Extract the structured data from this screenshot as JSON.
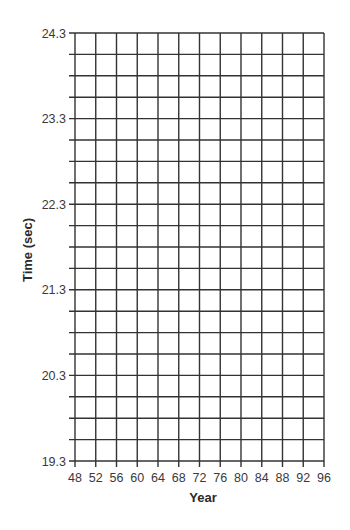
{
  "chart_data": {
    "type": "line",
    "title": "",
    "xlabel": "Year",
    "ylabel": "Time (sec)",
    "x_ticks": [
      48,
      52,
      56,
      60,
      64,
      68,
      72,
      76,
      80,
      84,
      88,
      92,
      96
    ],
    "x_tick_labels": [
      "48",
      "52",
      "56",
      "60",
      "64",
      "68",
      "72",
      "76",
      "80",
      "84",
      "88",
      "92",
      "96"
    ],
    "y_ticks_labeled": [
      19.3,
      20.3,
      21.3,
      22.3,
      23.3,
      24.3
    ],
    "y_tick_labels": [
      "19.3",
      "20.3",
      "21.3",
      "22.3",
      "23.3",
      "24.3"
    ],
    "y_minor_step": 0.25,
    "xlim": [
      48,
      96
    ],
    "ylim": [
      19.3,
      24.3
    ],
    "grid": true,
    "legend": null,
    "series": [],
    "note": "Blank graph-paper grid with no plotted data points"
  },
  "colors": {
    "grid": "#333333",
    "text": "#3a3a3a",
    "background": "#ffffff"
  }
}
